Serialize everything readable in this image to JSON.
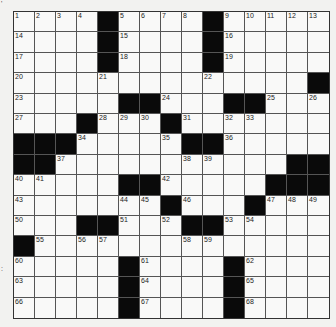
{
  "puzzle": {
    "rows": 15,
    "cols": 15,
    "grid": [
      [
        "1",
        "2",
        "3",
        "4",
        "#",
        "5",
        "6",
        "7",
        "8",
        "#",
        "9",
        "10",
        "11",
        "12",
        "13"
      ],
      [
        "14",
        "",
        "",
        "",
        "#",
        "15",
        "",
        "",
        "",
        "#",
        "16",
        "",
        "",
        "",
        ""
      ],
      [
        "17",
        "",
        "",
        "",
        "#",
        "18",
        "",
        "",
        "",
        "#",
        "19",
        "",
        "",
        "",
        ""
      ],
      [
        "20",
        "",
        "",
        "",
        "21",
        "",
        "",
        "",
        "",
        "22",
        "",
        "",
        "",
        "",
        "#"
      ],
      [
        "23",
        "",
        "",
        "",
        "",
        "#",
        "#",
        "24",
        "",
        "",
        "#",
        "#",
        "25",
        "",
        "26"
      ],
      [
        "27",
        "",
        "",
        "#",
        "28",
        "29",
        "30",
        "#",
        "31",
        "",
        "32",
        "33",
        "",
        "",
        ""
      ],
      [
        "#",
        "#",
        "#",
        "34",
        "",
        "",
        "",
        "35",
        "#",
        "#",
        "36",
        "",
        "",
        "",
        ""
      ],
      [
        "#",
        "#",
        "37",
        "",
        "",
        "",
        "",
        "",
        "38",
        "39",
        "",
        "",
        "",
        "#",
        "#"
      ],
      [
        "40",
        "41",
        "",
        "",
        "",
        "#",
        "#",
        "42",
        "",
        "",
        "",
        "",
        "#",
        "#",
        "#"
      ],
      [
        "43",
        "",
        "",
        "",
        "",
        "44",
        "45",
        "#",
        "46",
        "",
        "",
        "#",
        "47",
        "48",
        "49"
      ],
      [
        "50",
        "",
        "",
        "#",
        "#",
        "51",
        "",
        "52",
        "#",
        "#",
        "53",
        "54",
        "",
        "",
        ""
      ],
      [
        "#",
        "55",
        "",
        "56",
        "57",
        "",
        "",
        "",
        "58",
        "59",
        "",
        "",
        "",
        "",
        ""
      ],
      [
        "60",
        "",
        "",
        "",
        "",
        "#",
        "61",
        "",
        "",
        "",
        "#",
        "62",
        "",
        "",
        ""
      ],
      [
        "63",
        "",
        "",
        "",
        "",
        "#",
        "64",
        "",
        "",
        "",
        "#",
        "65",
        "",
        "",
        ""
      ],
      [
        "66",
        "",
        "",
        "",
        "",
        "#",
        "67",
        "",
        "",
        "",
        "#",
        "68",
        "",
        "",
        ""
      ]
    ]
  },
  "margin_marks": [
    {
      "text": "'",
      "top": 0
    },
    {
      "text": ":",
      "top": 265
    }
  ]
}
